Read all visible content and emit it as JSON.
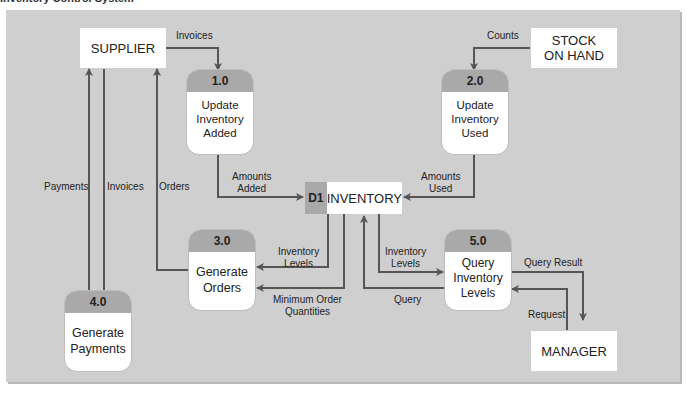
{
  "title": "Inventory Control System",
  "colors": {
    "panel": "#cfcfcf",
    "header": "#a9a9a9",
    "arrow": "#555555",
    "box": "#ffffff"
  },
  "entities": {
    "supplier": "SUPPLIER",
    "stock_on_hand_1": "STOCK",
    "stock_on_hand_2": "ON HAND",
    "manager": "MANAGER"
  },
  "processes": [
    {
      "id": "1.0",
      "line1": "Update",
      "line2": "Inventory",
      "line3": "Added"
    },
    {
      "id": "2.0",
      "line1": "Update",
      "line2": "Inventory",
      "line3": "Used"
    },
    {
      "id": "3.0",
      "line1": "Generate",
      "line2": "Orders",
      "line3": ""
    },
    {
      "id": "4.0",
      "line1": "Generate",
      "line2": "Payments",
      "line3": ""
    },
    {
      "id": "5.0",
      "line1": "Query",
      "line2": "Inventory",
      "line3": "Levels"
    }
  ],
  "data_store": {
    "id": "D1",
    "name": "INVENTORY"
  },
  "flows": {
    "invoices_top": "Invoices",
    "counts": "Counts",
    "amounts_added_1": "Amounts",
    "amounts_added_2": "Added",
    "amounts_used_1": "Amounts",
    "amounts_used_2": "Used",
    "payments": "Payments",
    "invoices_left": "Invoices",
    "orders": "Orders",
    "inv_levels_3_1": "Inventory",
    "inv_levels_3_2": "Levels",
    "min_order_1": "Minimum Order",
    "min_order_2": "Quantities",
    "inv_levels_5_1": "Inventory",
    "inv_levels_5_2": "Levels",
    "query": "Query",
    "query_result": "Query Result",
    "request": "Request"
  }
}
